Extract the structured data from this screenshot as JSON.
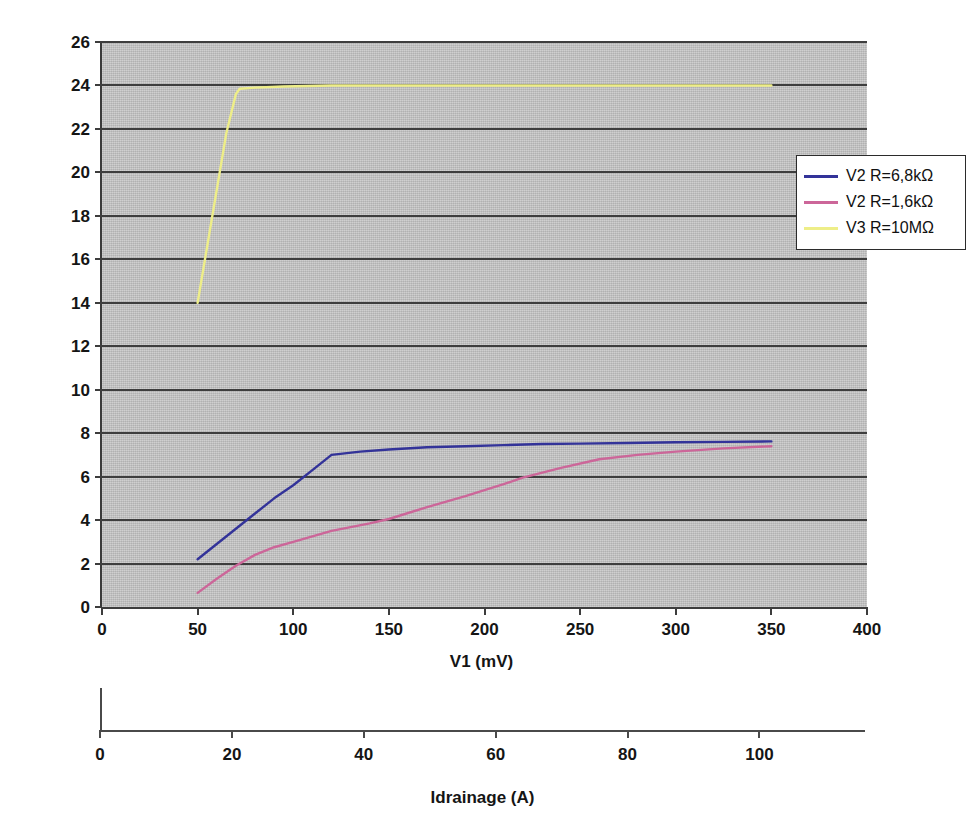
{
  "chart_data": {
    "type": "line",
    "title": "",
    "xlabel": "V1 (mV)",
    "ylabel": "V2, V3 (V)",
    "xlim": [
      0,
      400
    ],
    "ylim": [
      0,
      26
    ],
    "xticks": [
      0,
      50,
      100,
      150,
      200,
      250,
      300,
      350,
      400
    ],
    "yticks": [
      0,
      2,
      4,
      6,
      8,
      10,
      12,
      14,
      16,
      18,
      20,
      22,
      24,
      26
    ],
    "grid": "horizontal",
    "plot_background": "#c2c2c2",
    "legend_position": "upper right",
    "series": [
      {
        "name": "V2 R=6,8kΩ",
        "color": "#333399",
        "x": [
          50,
          60,
          70,
          80,
          90,
          100,
          110,
          120,
          135,
          150,
          170,
          190,
          210,
          230,
          250,
          275,
          300,
          325,
          350
        ],
        "y": [
          2.2,
          2.9,
          3.6,
          4.3,
          5.0,
          5.6,
          6.3,
          7.0,
          7.15,
          7.25,
          7.35,
          7.4,
          7.45,
          7.5,
          7.52,
          7.55,
          7.58,
          7.6,
          7.62
        ]
      },
      {
        "name": "V2 R=1,6kΩ",
        "color": "#cc6699",
        "x": [
          50,
          60,
          70,
          80,
          90,
          100,
          120,
          140,
          150,
          170,
          190,
          210,
          220,
          240,
          260,
          280,
          300,
          325,
          350
        ],
        "y": [
          0.65,
          1.3,
          1.9,
          2.4,
          2.75,
          3.0,
          3.5,
          3.85,
          4.05,
          4.6,
          5.1,
          5.65,
          5.95,
          6.4,
          6.8,
          7.0,
          7.15,
          7.3,
          7.4
        ]
      },
      {
        "name": "V3 R=10MΩ",
        "color": "#eeee88",
        "x": [
          50,
          55,
          60,
          65,
          70,
          72,
          80,
          95,
          120,
          160,
          200,
          250,
          300,
          350
        ],
        "y": [
          14.0,
          16.6,
          19.2,
          21.8,
          23.6,
          23.85,
          23.9,
          23.95,
          24.0,
          24.0,
          24.0,
          24.0,
          24.0,
          24.0
        ]
      }
    ],
    "secondary_axis": {
      "label": "Idrainage (A)",
      "ticks": [
        0,
        20,
        40,
        60,
        80,
        100
      ],
      "min": 0,
      "max": 116
    }
  },
  "colors": {
    "series_blue": "#333399",
    "series_pink": "#cc6699",
    "series_yellow": "#eeee88",
    "plot_background": "#c2c2c2",
    "gridline": "#3d3d3d",
    "axis_text": "#151515"
  }
}
